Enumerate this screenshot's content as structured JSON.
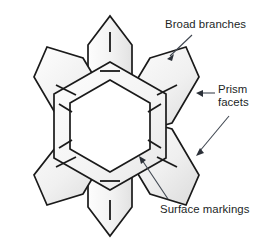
{
  "figure": {
    "kind": "snowflake-crystal-diagram",
    "title_visible": false,
    "background_color": "#ffffff",
    "stroke_color": "#1a1a1a",
    "facet_fill_light": "#fbfbfb",
    "facet_fill_dark": "#e4e4e4",
    "inner_core_fill": "#ffffff",
    "leader_line_color": "#3a3f4a",
    "text_color": "#221f1f",
    "branch_count": 6,
    "surface_mark_count": 12
  },
  "labels": {
    "broad_branches": "Broad branches",
    "prism_facets_line1": "Prism",
    "prism_facets_line2": "facets",
    "surface_markings": "Surface markings"
  },
  "annotations": [
    {
      "id": "broad-branches",
      "text": "Broad branches",
      "arrow_from": [
        191,
        36
      ],
      "arrow_to": [
        168,
        58
      ],
      "points_at": "upper-right-branch-top-edge"
    },
    {
      "id": "prism-facets-upper",
      "text": "Prism facets",
      "arrow_from": [
        214,
        93
      ],
      "arrow_to": [
        197,
        93
      ],
      "points_at": "upper-right-branch-right-facet"
    },
    {
      "id": "prism-facets-lower",
      "text": "Prism facets",
      "arrow_from": [
        228,
        117
      ],
      "arrow_to": [
        196,
        155
      ],
      "points_at": "lower-right-branch-right-facet"
    },
    {
      "id": "surface-markings",
      "text": "Surface markings",
      "arrow_from": [
        167,
        200
      ],
      "arrow_to": [
        139,
        157
      ],
      "points_at": "inner-ring-tick-mark"
    }
  ]
}
